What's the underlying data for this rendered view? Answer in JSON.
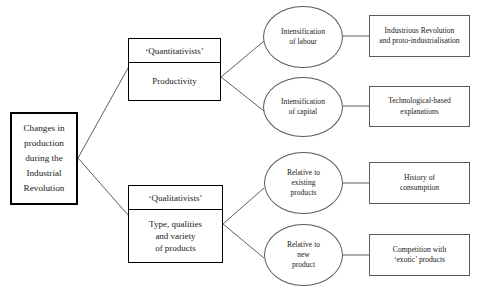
{
  "diagram": {
    "type": "tree-diagram",
    "orientation": "left-to-right",
    "line_color": "#4d4d4d",
    "border_color_thick": "#000000",
    "border_color_thin": "#5a5a5a",
    "background": "#ffffff"
  },
  "root": {
    "name": "changes-in-production",
    "lines": [
      "Changes in",
      "production",
      "during the",
      "Industrial",
      "Revolution"
    ]
  },
  "branches": [
    {
      "name": "quantitativists",
      "header": "‘Quantitativists’",
      "body_lines": [
        "Productivity"
      ],
      "children": [
        {
          "name": "intensification-of-labour",
          "lines": [
            "Intensification",
            "of labour"
          ],
          "outcome": {
            "name": "industrious-revolution",
            "lines": [
              "Industrious Revolution",
              "and proto-industrialisation"
            ]
          }
        },
        {
          "name": "intensification-of-capital",
          "lines": [
            "Intensification",
            "of capital"
          ],
          "outcome": {
            "name": "technological-based-explanations",
            "lines": [
              "Technological-based",
              "explanations"
            ]
          }
        }
      ]
    },
    {
      "name": "qualitativists",
      "header": "‘Qualitativists’",
      "body_lines": [
        "Type, qualities",
        "and variety",
        "of products"
      ],
      "children": [
        {
          "name": "relative-to-existing-products",
          "lines": [
            "Relative to",
            "existing",
            "products"
          ],
          "outcome": {
            "name": "history-of-consumption",
            "lines": [
              "History of",
              "consumption"
            ]
          }
        },
        {
          "name": "relative-to-new-product",
          "lines": [
            "Relative to",
            "new",
            "product"
          ],
          "outcome": {
            "name": "competition-with-exotic-products",
            "lines": [
              "Competition with",
              "‘exotic’ products"
            ]
          }
        }
      ]
    }
  ]
}
